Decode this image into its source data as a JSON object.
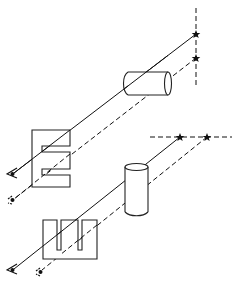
{
  "diagram": {
    "title": "",
    "colors": {
      "line": "#111111",
      "background": "#ffffff"
    },
    "upper_setup": {
      "source_line": {
        "orientation": "vertical",
        "style": "dashed"
      },
      "sources": [
        {
          "type": "star",
          "ray": "solid"
        },
        {
          "type": "star",
          "ray": "dashed"
        }
      ],
      "obstacle": {
        "type": "cylinder",
        "orientation": "horizontal"
      },
      "block": {
        "type": "slotted-block",
        "slots": 2,
        "slot_orientation": "horizontal"
      },
      "observers": [
        {
          "type": "eye",
          "ray": "solid"
        },
        {
          "type": "eye",
          "ray": "dashed"
        }
      ]
    },
    "lower_setup": {
      "source_line": {
        "orientation": "horizontal",
        "style": "dashed"
      },
      "sources": [
        {
          "type": "star",
          "ray": "solid"
        },
        {
          "type": "star",
          "ray": "dashed"
        }
      ],
      "obstacle": {
        "type": "cylinder",
        "orientation": "vertical"
      },
      "block": {
        "type": "slotted-block",
        "slots": 2,
        "slot_orientation": "vertical"
      },
      "observers": [
        {
          "type": "eye",
          "ray": "solid"
        },
        {
          "type": "eye",
          "ray": "dashed"
        }
      ]
    }
  }
}
